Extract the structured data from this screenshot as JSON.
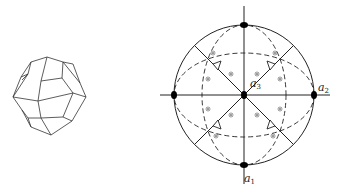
{
  "figure": {
    "left_panel": {
      "description": "Crystal polyhedron drawing (hexoctahedral-like form)"
    },
    "right_panel": {
      "description": "Stereographic projection",
      "axes": [
        {
          "name": "a1",
          "symbol": "a",
          "subscript": "1",
          "position": "bottom"
        },
        {
          "name": "a2",
          "symbol": "a",
          "subscript": "2",
          "position": "right"
        },
        {
          "name": "a3",
          "symbol": "a",
          "subscript": "3",
          "position": "center"
        }
      ],
      "symmetry_elements": {
        "poles_filled_ellipse": 5,
        "triangles_threefold": 4,
        "face_poles_circled_dot": 16
      }
    }
  },
  "colors": {
    "line": "#222222",
    "background": "#ffffff",
    "face_pole": "#555555"
  }
}
